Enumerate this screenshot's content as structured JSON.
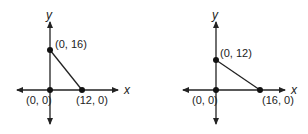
{
  "graphs": [
    {
      "x_axis_label": "x",
      "y_axis_label": "y",
      "points": [
        {
          "label": "(0, 16)",
          "x": 0,
          "y": 16
        },
        {
          "label": "(0, 0)",
          "x": 0,
          "y": 0
        },
        {
          "label": "(12, 0)",
          "x": 12,
          "y": 0
        }
      ]
    },
    {
      "x_axis_label": "x",
      "y_axis_label": "y",
      "points": [
        {
          "label": "(0, 12)",
          "x": 0,
          "y": 12
        },
        {
          "label": "(0, 0)",
          "x": 0,
          "y": 0
        },
        {
          "label": "(16, 0)",
          "x": 16,
          "y": 0
        }
      ]
    }
  ],
  "style": {
    "line_color": "#222222",
    "point_color": "#111111"
  }
}
